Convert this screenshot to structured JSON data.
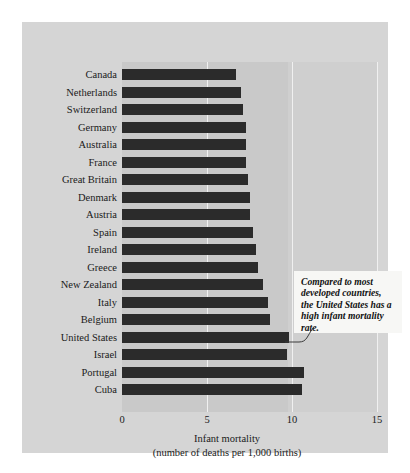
{
  "chart_data": {
    "type": "bar",
    "orientation": "horizontal",
    "title": "",
    "xlabel": "Infant mortality",
    "xlabel_sub": "(number of deaths per 1,000 births)",
    "ylabel": "",
    "xlim": [
      0,
      15
    ],
    "xticks": [
      0,
      5,
      10,
      15
    ],
    "xtick_labels": [
      "0",
      "5",
      "10",
      "15"
    ],
    "grid": true,
    "legend": null,
    "categories": [
      "Canada",
      "Netherlands",
      "Switzerland",
      "Germany",
      "Australia",
      "France",
      "Great Britain",
      "Denmark",
      "Austria",
      "Spain",
      "Ireland",
      "Greece",
      "New Zealand",
      "Italy",
      "Belgium",
      "United States",
      "Israel",
      "Portugal",
      "Cuba"
    ],
    "values": [
      6.7,
      7.0,
      7.1,
      7.3,
      7.3,
      7.3,
      7.4,
      7.5,
      7.5,
      7.7,
      7.9,
      8.0,
      8.3,
      8.6,
      8.7,
      9.8,
      9.7,
      10.7,
      10.6
    ],
    "annotations": [
      {
        "text": "Compared to most developed countries, the United States has a high infant mortality rate.",
        "target_category": "United States"
      }
    ],
    "colors": {
      "bar": "#2b2b2b",
      "plot_background": "#c9c9c9",
      "plot_background_light": "#cfcfcf",
      "figure_background": "#d5d5d5",
      "gridline": "#f0f0f0",
      "annotation_background": "#f7f7f5",
      "text": "#1a1a1a"
    }
  }
}
